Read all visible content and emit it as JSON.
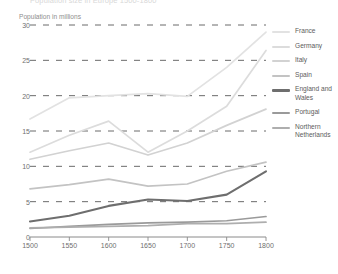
{
  "chart": {
    "title": "Population size in Europe 1500-1800",
    "ylabel": "Population in millions",
    "xlabel": ""
  },
  "axis": {
    "y_ticks": [
      "30",
      "25",
      "20",
      "15",
      "10",
      "5",
      "0"
    ],
    "x_ticks": [
      "1500",
      "1550",
      "1600",
      "1650",
      "1700",
      "1750",
      "1800"
    ]
  },
  "legend": {
    "items": [
      {
        "label": "France",
        "color": "#e2e2e2"
      },
      {
        "label": "Germany",
        "color": "#dcdcdc"
      },
      {
        "label": "Italy",
        "color": "#d2d2d2"
      },
      {
        "label": "Spain",
        "color": "#c3c3c3"
      },
      {
        "label": "England and Wales",
        "color": "#6e6e6e"
      },
      {
        "label": "Portugal",
        "color": "#9a9a9a"
      },
      {
        "label": "Northern Netherlands",
        "color": "#aeaeae"
      }
    ]
  },
  "chart_data": {
    "type": "line",
    "title": "Population size in Europe 1500-1800",
    "xlabel": "",
    "ylabel": "Population in millions",
    "x": [
      1500,
      1550,
      1600,
      1650,
      1700,
      1750,
      1800
    ],
    "xlim": [
      1500,
      1800
    ],
    "ylim": [
      0,
      30
    ],
    "grid": true,
    "legend_position": "right",
    "series": [
      {
        "name": "France",
        "color": "#e2e2e2",
        "values": [
          16.7,
          19.7,
          20.0,
          20.3,
          19.9,
          24.0,
          29.0
        ]
      },
      {
        "name": "Germany",
        "color": "#dcdcdc",
        "values": [
          12.0,
          14.4,
          16.4,
          12.0,
          15.0,
          18.5,
          26.4
        ]
      },
      {
        "name": "Italy",
        "color": "#d2d2d2",
        "values": [
          11.0,
          12.2,
          13.3,
          11.6,
          13.3,
          15.8,
          18.1
        ]
      },
      {
        "name": "Spain",
        "color": "#c3c3c3",
        "values": [
          6.8,
          7.4,
          8.2,
          7.2,
          7.5,
          9.3,
          10.6
        ]
      },
      {
        "name": "England and Wales",
        "color": "#6e6e6e",
        "values": [
          2.2,
          3.0,
          4.4,
          5.3,
          5.1,
          6.0,
          9.3
        ]
      },
      {
        "name": "Portugal",
        "color": "#9a9a9a",
        "values": [
          1.2,
          1.5,
          1.8,
          2.0,
          2.1,
          2.3,
          2.9
        ]
      },
      {
        "name": "Northern Netherlands",
        "color": "#aeaeae",
        "values": [
          1.3,
          1.4,
          1.5,
          1.6,
          1.9,
          1.9,
          2.1
        ]
      }
    ]
  }
}
